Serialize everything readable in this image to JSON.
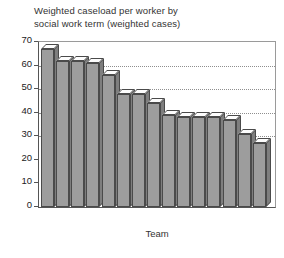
{
  "chart_data": {
    "type": "bar",
    "title": "Weighted caseload per worker by\nsocial work term (weighted cases)",
    "xlabel": "Team",
    "ylabel": "",
    "ylim": [
      0,
      70
    ],
    "ytick_step": 10,
    "yticks": [
      "70",
      "60",
      "50",
      "40",
      "30",
      "20",
      "10",
      "0"
    ],
    "grid": true,
    "gridlines_at": [
      60,
      50,
      40,
      30
    ],
    "legend": null,
    "categories": [
      "1",
      "2",
      "3",
      "4",
      "5",
      "6",
      "7",
      "8",
      "9",
      "10",
      "11",
      "12",
      "13",
      "14",
      "15"
    ],
    "values": [
      67,
      62,
      62,
      61,
      56,
      48,
      48,
      44,
      39,
      38,
      38,
      38,
      37,
      31,
      27
    ],
    "series": [
      {
        "name": "Weighted caseload per worker",
        "values": [
          67,
          62,
          62,
          61,
          56,
          48,
          48,
          44,
          39,
          38,
          38,
          38,
          37,
          31,
          27
        ]
      }
    ],
    "colors": {
      "bar_front": "#9d9d9d",
      "bar_top": "#fdfdfd",
      "bar_side": "#7e7e7e",
      "bar_outline": "#4a4a4a",
      "gridline": "#8e8e8e",
      "axis": "#555555",
      "frame": "#9a9a9a",
      "text": "#333333",
      "background": "#ffffff"
    }
  }
}
